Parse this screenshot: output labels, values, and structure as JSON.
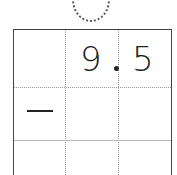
{
  "worksheet": {
    "row1": {
      "col1": "",
      "col2": "9",
      "col3": "5",
      "decimal_point": "."
    },
    "row2": {
      "col1": "—",
      "col2": "",
      "col3": ""
    },
    "row3": {
      "col1": "",
      "col2": "",
      "col3": ""
    }
  }
}
